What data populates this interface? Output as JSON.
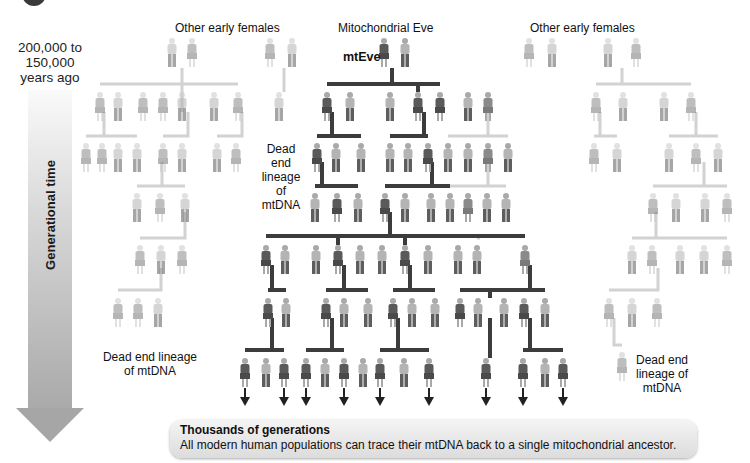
{
  "time_axis": {
    "range_label": "200,000 to 150,000 years ago",
    "range_lines": [
      "200,000  to",
      "150,000",
      "years ago"
    ],
    "arrow_label": "Generational time"
  },
  "labels": {
    "other_females_left": "Other early females",
    "mitochondrial_eve": "Mitochondrial Eve",
    "mteve": "mtEve",
    "other_females_right": "Other early females",
    "dead_end_center_left": [
      "Dead end",
      "lineage of",
      "mtDNA"
    ],
    "dead_end_bottom_left": [
      "Dead end lineage",
      "of mtDNA"
    ],
    "dead_end_right": [
      "Dead end",
      "lineage of",
      "mtDNA"
    ]
  },
  "note": {
    "title": "Thousands of generations",
    "body": "All modern human populations can trace their mtDNA back to a single mitochondrial ancestor."
  },
  "colors": {
    "lineage_line": "#3c3c3c",
    "dead_end_line": "#cfcfcf",
    "female": "#6e6e6e",
    "male": "#9a9a9a",
    "faded": "#bdbdbd"
  },
  "figures": [
    {
      "x": 172,
      "y": 38,
      "s": "m",
      "t": "f"
    },
    {
      "x": 192,
      "y": 38,
      "s": "f",
      "t": "f"
    },
    {
      "x": 270,
      "y": 38,
      "s": "f",
      "t": "f"
    },
    {
      "x": 292,
      "y": 38,
      "s": "m",
      "t": "f"
    },
    {
      "x": 384,
      "y": 38,
      "s": "f",
      "t": "l"
    },
    {
      "x": 405,
      "y": 38,
      "s": "m",
      "t": "n"
    },
    {
      "x": 529,
      "y": 38,
      "s": "f",
      "t": "f"
    },
    {
      "x": 552,
      "y": 38,
      "s": "m",
      "t": "f"
    },
    {
      "x": 608,
      "y": 38,
      "s": "m",
      "t": "f"
    },
    {
      "x": 636,
      "y": 38,
      "s": "f",
      "t": "f"
    },
    {
      "x": 100,
      "y": 92,
      "s": "f",
      "t": "f"
    },
    {
      "x": 118,
      "y": 92,
      "s": "m",
      "t": "f"
    },
    {
      "x": 143,
      "y": 92,
      "s": "f",
      "t": "f"
    },
    {
      "x": 163,
      "y": 92,
      "s": "f",
      "t": "f"
    },
    {
      "x": 182,
      "y": 92,
      "s": "m",
      "t": "f"
    },
    {
      "x": 214,
      "y": 92,
      "s": "m",
      "t": "f"
    },
    {
      "x": 238,
      "y": 92,
      "s": "f",
      "t": "f"
    },
    {
      "x": 279,
      "y": 92,
      "s": "m",
      "t": "f"
    },
    {
      "x": 327,
      "y": 92,
      "s": "f",
      "t": "l"
    },
    {
      "x": 350,
      "y": 92,
      "s": "m",
      "t": "n"
    },
    {
      "x": 390,
      "y": 92,
      "s": "m",
      "t": "n"
    },
    {
      "x": 418,
      "y": 92,
      "s": "f",
      "t": "l"
    },
    {
      "x": 440,
      "y": 92,
      "s": "f",
      "t": "l"
    },
    {
      "x": 468,
      "y": 92,
      "s": "m",
      "t": "n"
    },
    {
      "x": 488,
      "y": 92,
      "s": "f",
      "t": "n"
    },
    {
      "x": 596,
      "y": 92,
      "s": "f",
      "t": "f"
    },
    {
      "x": 623,
      "y": 92,
      "s": "m",
      "t": "f"
    },
    {
      "x": 664,
      "y": 92,
      "s": "m",
      "t": "f"
    },
    {
      "x": 691,
      "y": 92,
      "s": "f",
      "t": "f"
    },
    {
      "x": 86,
      "y": 143,
      "s": "f",
      "t": "f"
    },
    {
      "x": 102,
      "y": 143,
      "s": "f",
      "t": "f"
    },
    {
      "x": 118,
      "y": 143,
      "s": "m",
      "t": "f"
    },
    {
      "x": 137,
      "y": 143,
      "s": "m",
      "t": "f"
    },
    {
      "x": 163,
      "y": 143,
      "s": "f",
      "t": "f"
    },
    {
      "x": 182,
      "y": 143,
      "s": "m",
      "t": "f"
    },
    {
      "x": 217,
      "y": 143,
      "s": "m",
      "t": "f"
    },
    {
      "x": 236,
      "y": 143,
      "s": "f",
      "t": "f"
    },
    {
      "x": 317,
      "y": 143,
      "s": "f",
      "t": "l"
    },
    {
      "x": 336,
      "y": 143,
      "s": "m",
      "t": "n"
    },
    {
      "x": 361,
      "y": 143,
      "s": "m",
      "t": "n"
    },
    {
      "x": 390,
      "y": 143,
      "s": "m",
      "t": "n"
    },
    {
      "x": 408,
      "y": 143,
      "s": "m",
      "t": "n"
    },
    {
      "x": 428,
      "y": 143,
      "s": "f",
      "t": "l"
    },
    {
      "x": 448,
      "y": 143,
      "s": "m",
      "t": "n"
    },
    {
      "x": 468,
      "y": 143,
      "s": "m",
      "t": "n"
    },
    {
      "x": 488,
      "y": 143,
      "s": "f",
      "t": "n"
    },
    {
      "x": 508,
      "y": 143,
      "s": "m",
      "t": "n"
    },
    {
      "x": 594,
      "y": 143,
      "s": "f",
      "t": "f"
    },
    {
      "x": 617,
      "y": 143,
      "s": "m",
      "t": "f"
    },
    {
      "x": 669,
      "y": 143,
      "s": "m",
      "t": "f"
    },
    {
      "x": 696,
      "y": 143,
      "s": "f",
      "t": "f"
    },
    {
      "x": 718,
      "y": 143,
      "s": "m",
      "t": "f"
    },
    {
      "x": 137,
      "y": 193,
      "s": "m",
      "t": "f"
    },
    {
      "x": 160,
      "y": 193,
      "s": "f",
      "t": "f"
    },
    {
      "x": 185,
      "y": 193,
      "s": "m",
      "t": "f"
    },
    {
      "x": 315,
      "y": 193,
      "s": "m",
      "t": "n"
    },
    {
      "x": 337,
      "y": 193,
      "s": "f",
      "t": "l"
    },
    {
      "x": 358,
      "y": 193,
      "s": "m",
      "t": "n"
    },
    {
      "x": 385,
      "y": 193,
      "s": "f",
      "t": "l"
    },
    {
      "x": 405,
      "y": 193,
      "s": "m",
      "t": "n"
    },
    {
      "x": 431,
      "y": 193,
      "s": "m",
      "t": "n"
    },
    {
      "x": 450,
      "y": 193,
      "s": "m",
      "t": "n"
    },
    {
      "x": 468,
      "y": 193,
      "s": "f",
      "t": "n"
    },
    {
      "x": 487,
      "y": 193,
      "s": "m",
      "t": "n"
    },
    {
      "x": 506,
      "y": 193,
      "s": "m",
      "t": "n"
    },
    {
      "x": 653,
      "y": 193,
      "s": "f",
      "t": "f"
    },
    {
      "x": 676,
      "y": 193,
      "s": "m",
      "t": "f"
    },
    {
      "x": 705,
      "y": 193,
      "s": "m",
      "t": "f"
    },
    {
      "x": 727,
      "y": 193,
      "s": "f",
      "t": "f"
    },
    {
      "x": 140,
      "y": 245,
      "s": "f",
      "t": "f"
    },
    {
      "x": 161,
      "y": 245,
      "s": "m",
      "t": "f"
    },
    {
      "x": 182,
      "y": 245,
      "s": "f",
      "t": "f"
    },
    {
      "x": 266,
      "y": 245,
      "s": "f",
      "t": "l"
    },
    {
      "x": 285,
      "y": 245,
      "s": "m",
      "t": "n"
    },
    {
      "x": 316,
      "y": 245,
      "s": "m",
      "t": "n"
    },
    {
      "x": 338,
      "y": 245,
      "s": "f",
      "t": "l"
    },
    {
      "x": 360,
      "y": 245,
      "s": "m",
      "t": "n"
    },
    {
      "x": 382,
      "y": 245,
      "s": "m",
      "t": "n"
    },
    {
      "x": 405,
      "y": 245,
      "s": "f",
      "t": "l"
    },
    {
      "x": 428,
      "y": 245,
      "s": "m",
      "t": "n"
    },
    {
      "x": 458,
      "y": 245,
      "s": "m",
      "t": "n"
    },
    {
      "x": 477,
      "y": 245,
      "s": "m",
      "t": "n"
    },
    {
      "x": 525,
      "y": 245,
      "s": "f",
      "t": "n"
    },
    {
      "x": 632,
      "y": 245,
      "s": "m",
      "t": "f"
    },
    {
      "x": 652,
      "y": 245,
      "s": "f",
      "t": "f"
    },
    {
      "x": 680,
      "y": 245,
      "s": "m",
      "t": "f"
    },
    {
      "x": 704,
      "y": 245,
      "s": "m",
      "t": "f"
    },
    {
      "x": 727,
      "y": 245,
      "s": "f",
      "t": "f"
    },
    {
      "x": 118,
      "y": 298,
      "s": "f",
      "t": "f"
    },
    {
      "x": 138,
      "y": 298,
      "s": "f",
      "t": "f"
    },
    {
      "x": 158,
      "y": 298,
      "s": "m",
      "t": "f"
    },
    {
      "x": 268,
      "y": 298,
      "s": "f",
      "t": "l"
    },
    {
      "x": 286,
      "y": 298,
      "s": "m",
      "t": "n"
    },
    {
      "x": 326,
      "y": 298,
      "s": "f",
      "t": "l"
    },
    {
      "x": 344,
      "y": 298,
      "s": "m",
      "t": "n"
    },
    {
      "x": 368,
      "y": 298,
      "s": "m",
      "t": "n"
    },
    {
      "x": 393,
      "y": 298,
      "s": "f",
      "t": "l"
    },
    {
      "x": 412,
      "y": 298,
      "s": "m",
      "t": "n"
    },
    {
      "x": 435,
      "y": 298,
      "s": "m",
      "t": "n"
    },
    {
      "x": 460,
      "y": 298,
      "s": "f",
      "t": "l"
    },
    {
      "x": 478,
      "y": 298,
      "s": "m",
      "t": "n"
    },
    {
      "x": 504,
      "y": 298,
      "s": "m",
      "t": "n"
    },
    {
      "x": 524,
      "y": 298,
      "s": "f",
      "t": "l"
    },
    {
      "x": 545,
      "y": 298,
      "s": "m",
      "t": "n"
    },
    {
      "x": 609,
      "y": 298,
      "s": "f",
      "t": "f"
    },
    {
      "x": 632,
      "y": 298,
      "s": "m",
      "t": "f"
    },
    {
      "x": 657,
      "y": 298,
      "s": "f",
      "t": "f"
    },
    {
      "x": 245,
      "y": 358,
      "s": "f",
      "t": "l"
    },
    {
      "x": 266,
      "y": 358,
      "s": "m",
      "t": "n"
    },
    {
      "x": 284,
      "y": 358,
      "s": "f",
      "t": "l"
    },
    {
      "x": 306,
      "y": 358,
      "s": "f",
      "t": "l"
    },
    {
      "x": 325,
      "y": 358,
      "s": "m",
      "t": "n"
    },
    {
      "x": 344,
      "y": 358,
      "s": "f",
      "t": "l"
    },
    {
      "x": 363,
      "y": 358,
      "s": "m",
      "t": "n"
    },
    {
      "x": 380,
      "y": 358,
      "s": "f",
      "t": "l"
    },
    {
      "x": 404,
      "y": 358,
      "s": "m",
      "t": "n"
    },
    {
      "x": 429,
      "y": 358,
      "s": "f",
      "t": "l"
    },
    {
      "x": 486,
      "y": 358,
      "s": "f",
      "t": "l"
    },
    {
      "x": 523,
      "y": 358,
      "s": "f",
      "t": "l"
    },
    {
      "x": 545,
      "y": 358,
      "s": "m",
      "t": "n"
    },
    {
      "x": 563,
      "y": 358,
      "s": "f",
      "t": "l"
    },
    {
      "x": 622,
      "y": 352,
      "s": "f",
      "t": "f"
    }
  ],
  "arrow_tips_x": [
    245,
    284,
    306,
    344,
    380,
    429,
    486,
    523,
    563
  ]
}
